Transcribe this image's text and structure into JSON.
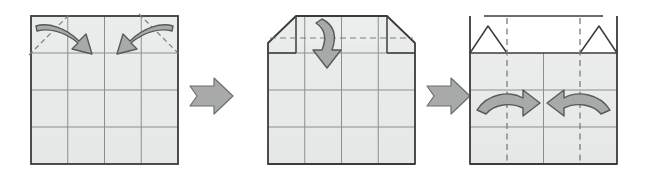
{
  "figure": {
    "kind": "origami-fold-instruction-diagram",
    "title": "Origami folding sequence: fold top corners, fold top edge down, fold sides inward",
    "background_color": "#ffffff",
    "canvas": {
      "width": 646,
      "height": 181
    }
  },
  "style": {
    "paper_fill": "#e8e9e9",
    "paper_fill_light": "#ffffff",
    "paper_outline": "#3b3b3b",
    "crease_line": "#8d8f8f",
    "dashed_fold_line": "#7a7c7c",
    "arrow_fill": "#a8a9a9",
    "arrow_stroke": "#58595a",
    "step_arrow_fill": "#a8a9a9",
    "step_arrow_stroke": "#6e6f70"
  },
  "panels": [
    {
      "id": "panel-1",
      "index": 1,
      "label": "Step 1",
      "shape": "square",
      "description": "Square sheet with 4 by 4 grid of crease lines; both top corners marked with diagonal dashed fold lines and curved arrows folding them inward and down.",
      "geometry": {
        "x": 31,
        "y": 16,
        "width": 147,
        "height": 148
      },
      "grid": {
        "columns": 4,
        "rows": 4
      },
      "dashed_folds": [
        {
          "name": "top-left-diagonal-fold",
          "x1": 31,
          "y1": 53,
          "x2": 68,
          "y2": 16
        },
        {
          "name": "top-right-diagonal-fold",
          "x1": 141,
          "y1": 16,
          "x2": 178,
          "y2": 53
        }
      ],
      "arrows": [
        {
          "name": "fold-arrow-top-left",
          "direction": "down-right",
          "curve": "clockwise"
        },
        {
          "name": "fold-arrow-top-right",
          "direction": "down-left",
          "curve": "counter-clockwise"
        }
      ]
    },
    {
      "id": "panel-2",
      "index": 2,
      "label": "Step 2",
      "shape": "square-with-folded-top-corners",
      "description": "Both top corners folded down forming angled edges; a horizontal dashed fold line crosses the top band and a curved arrow points downward to fold the top edge down.",
      "geometry": {
        "x": 268,
        "y": 16,
        "width": 147,
        "height": 148
      },
      "grid": {
        "columns": 4,
        "rows": 4
      },
      "dashed_folds": [
        {
          "name": "horizontal-top-fold",
          "x1": 268,
          "y1": 43,
          "x2": 415,
          "y2": 43
        }
      ],
      "arrows": [
        {
          "name": "fold-arrow-down",
          "direction": "down",
          "curve": "clockwise"
        }
      ]
    },
    {
      "id": "panel-3",
      "index": 3,
      "label": "Step 3",
      "shape": "square-with-open-top-band",
      "description": "Top band is white with two small triangular peaks at the corners; two vertical dashed fold lines with curved arrows pointing inward to fold both sides toward the center.",
      "geometry": {
        "x": 470,
        "y": 16,
        "width": 147,
        "height": 148
      },
      "grid": {
        "columns": 4,
        "rows": 4
      },
      "dashed_folds": [
        {
          "name": "left-vertical-fold",
          "x1": 507,
          "y1": 16,
          "x2": 507,
          "y2": 164
        },
        {
          "name": "right-vertical-fold",
          "x1": 580,
          "y1": 16,
          "x2": 580,
          "y2": 164
        }
      ],
      "arrows": [
        {
          "name": "fold-arrow-right",
          "direction": "right",
          "curve": "arc-over"
        },
        {
          "name": "fold-arrow-left",
          "direction": "left",
          "curve": "arc-over"
        }
      ]
    }
  ],
  "step_arrows": [
    {
      "name": "step-arrow-1-to-2",
      "from": "panel-1",
      "to": "panel-2",
      "direction": "right",
      "x": 190,
      "y": 96
    },
    {
      "name": "step-arrow-2-to-3",
      "from": "panel-2",
      "to": "panel-3",
      "direction": "right",
      "x": 427,
      "y": 96
    }
  ]
}
